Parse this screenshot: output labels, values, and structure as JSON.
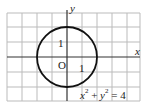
{
  "diagram": {
    "axis_x_label": "x",
    "axis_y_label": "y",
    "origin_label": "O",
    "tick_x_label": "1",
    "tick_y_label": "1",
    "equation": {
      "x": "x",
      "exp1": "2",
      "plus": " + ",
      "y": "y",
      "exp2": "2",
      "equals": " = 4"
    },
    "colors": {
      "grid": "#bbbbbb",
      "axis": "#333333",
      "curve": "#111111"
    }
  }
}
